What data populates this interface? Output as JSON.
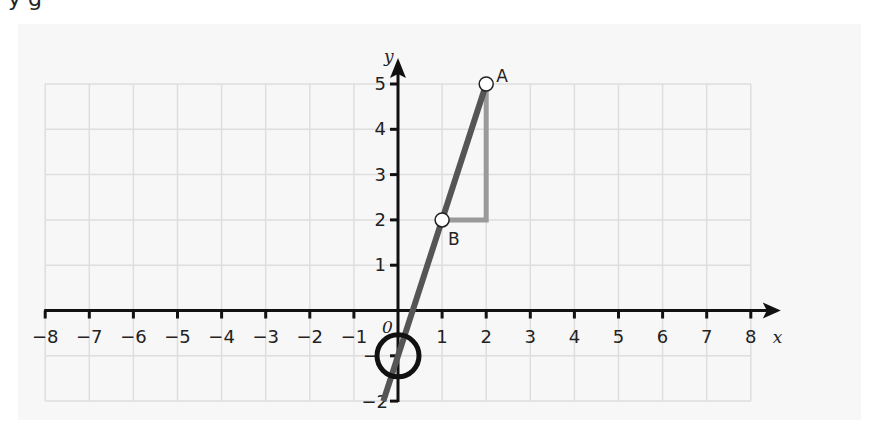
{
  "header": {
    "cut_text": "y                                        g"
  },
  "colors": {
    "panel_bg": "#f7f7f7",
    "grid": "#dedede",
    "axis": "#111111",
    "line": "#555555",
    "triangle": "#9a9a9a",
    "circle": "#111111"
  },
  "chart_data": {
    "type": "line",
    "title": "",
    "xlabel": "x",
    "ylabel": "y",
    "origin_label": "0",
    "xlim": [
      -8,
      8
    ],
    "ylim": [
      -2,
      5
    ],
    "grid": true,
    "x_ticks": [
      "-8",
      "-7",
      "-6",
      "-5",
      "-4",
      "-3",
      "-2",
      "-1",
      "1",
      "2",
      "3",
      "4",
      "5",
      "6",
      "7",
      "8"
    ],
    "y_ticks": [
      "1",
      "2",
      "3",
      "4",
      "5"
    ],
    "y_negative_ticks": [
      "-1",
      "-2"
    ],
    "series": [
      {
        "name": "line through A and B",
        "equation": "y = 3x - 1",
        "x": [
          -0.333,
          2
        ],
        "y": [
          -2,
          5
        ]
      }
    ],
    "points": [
      {
        "label": "A",
        "x": 2,
        "y": 5
      },
      {
        "label": "B",
        "x": 1,
        "y": 2
      }
    ],
    "annotations": [
      {
        "type": "gradient-triangle",
        "from": [
          1,
          2
        ],
        "corner": [
          2,
          2
        ],
        "to": [
          2,
          5
        ],
        "run": 1,
        "rise": 3
      },
      {
        "type": "circle",
        "center": [
          0,
          -1
        ],
        "note": "y-intercept highlighted"
      }
    ]
  }
}
